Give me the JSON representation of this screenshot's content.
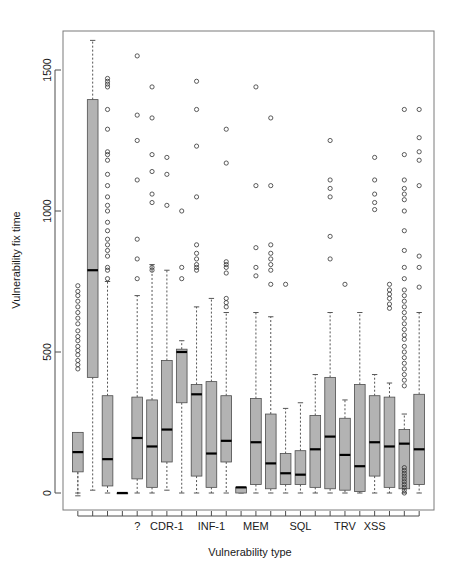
{
  "chart_data": {
    "type": "box",
    "title": "",
    "xlabel": "Vulnerability type",
    "ylabel": "Vulnerability fix time",
    "ylim": [
      -60,
      1680
    ],
    "yticks": [
      0,
      500,
      1000,
      1500
    ],
    "ytick_labels": [
      "0",
      "500",
      "1000",
      "1500"
    ],
    "grid": false,
    "legend": null,
    "n_categories": 24,
    "visible_category_labels": [
      "?",
      "CDR-1",
      "INF-1",
      "MEM",
      "SQL",
      "TRV",
      "XSS"
    ],
    "visible_category_label_indices": [
      4,
      6,
      9,
      12,
      15,
      18,
      20
    ],
    "box_fill_color": "#b3b3b3",
    "box_edge_color": "#4d4d4d",
    "median_color": "#000000",
    "whisker_style": "dashed",
    "outlier_marker": "open-circle",
    "boxes": [
      {
        "index": 0,
        "label": "",
        "lower_whisker": 0,
        "q1": 75,
        "median": 145,
        "q3": 215,
        "upper_whisker": -10,
        "outliers": [
          440,
          455,
          470,
          490,
          505,
          520,
          540,
          555,
          575,
          600,
          620,
          640,
          660,
          680,
          700,
          715,
          735
        ]
      },
      {
        "index": 1,
        "label": "",
        "lower_whisker": 10,
        "q1": 410,
        "median": 790,
        "q3": 1395,
        "upper_whisker": 1605,
        "outliers": []
      },
      {
        "index": 2,
        "label": "",
        "lower_whisker": 0,
        "q1": 25,
        "median": 120,
        "q3": 345,
        "upper_whisker": 750,
        "outliers": [
          760,
          790,
          800,
          840,
          860,
          880,
          900,
          930,
          960,
          1000,
          1020,
          1050,
          1090,
          1130,
          1180,
          1200,
          1210,
          1290,
          1360,
          1440,
          1450,
          1460,
          1470
        ]
      },
      {
        "index": 3,
        "label": "",
        "lower_whisker": 0,
        "q1": 0,
        "median": 0,
        "q3": 0,
        "upper_whisker": 0,
        "outliers": []
      },
      {
        "index": 4,
        "label": "?",
        "lower_whisker": 0,
        "q1": 50,
        "median": 195,
        "q3": 340,
        "upper_whisker": 700,
        "outliers": [
          760,
          830,
          900,
          1110,
          1250,
          1340,
          1550
        ]
      },
      {
        "index": 5,
        "label": "",
        "lower_whisker": 0,
        "q1": 20,
        "median": 165,
        "q3": 330,
        "upper_whisker": 810,
        "outliers": [
          790,
          800,
          1030,
          1060,
          1140,
          1200,
          1330,
          1440
        ]
      },
      {
        "index": 6,
        "label": "CDR-1",
        "lower_whisker": 10,
        "q1": 110,
        "median": 225,
        "q3": 470,
        "upper_whisker": 790,
        "outliers": [
          1020,
          1130,
          1190
        ]
      },
      {
        "index": 7,
        "label": "",
        "lower_whisker": 0,
        "q1": 320,
        "median": 500,
        "q3": 510,
        "upper_whisker": 540,
        "outliers": [
          760,
          800,
          1000
        ]
      },
      {
        "index": 8,
        "label": "",
        "lower_whisker": 0,
        "q1": 60,
        "median": 350,
        "q3": 385,
        "upper_whisker": 660,
        "outliers": [
          790,
          800,
          810,
          830,
          850,
          880,
          1050,
          1230,
          1360,
          1460
        ]
      },
      {
        "index": 9,
        "label": "INF-1",
        "lower_whisker": 0,
        "q1": 20,
        "median": 140,
        "q3": 395,
        "upper_whisker": 690,
        "outliers": []
      },
      {
        "index": 10,
        "label": "",
        "lower_whisker": 0,
        "q1": 110,
        "median": 185,
        "q3": 345,
        "upper_whisker": 640,
        "outliers": [
          660,
          675,
          690,
          780,
          800,
          810,
          820,
          1170,
          1290
        ]
      },
      {
        "index": 11,
        "label": "",
        "lower_whisker": 0,
        "q1": 0,
        "median": 20,
        "q3": 20,
        "upper_whisker": 20,
        "outliers": []
      },
      {
        "index": 12,
        "label": "MEM",
        "lower_whisker": 0,
        "q1": 30,
        "median": 180,
        "q3": 335,
        "upper_whisker": 640,
        "outliers": [
          770,
          800,
          870,
          1090,
          1440
        ]
      },
      {
        "index": 13,
        "label": "",
        "lower_whisker": 0,
        "q1": 15,
        "median": 105,
        "q3": 280,
        "upper_whisker": 625,
        "outliers": [
          740,
          790,
          810,
          830,
          850,
          880,
          1090,
          1330
        ]
      },
      {
        "index": 14,
        "label": "",
        "lower_whisker": 0,
        "q1": 30,
        "median": 70,
        "q3": 140,
        "upper_whisker": 300,
        "outliers": [
          740
        ]
      },
      {
        "index": 15,
        "label": "SQL",
        "lower_whisker": 0,
        "q1": 30,
        "median": 65,
        "q3": 150,
        "upper_whisker": 320,
        "outliers": []
      },
      {
        "index": 16,
        "label": "",
        "lower_whisker": 0,
        "q1": 20,
        "median": 155,
        "q3": 275,
        "upper_whisker": 420,
        "outliers": []
      },
      {
        "index": 17,
        "label": "",
        "lower_whisker": 0,
        "q1": 15,
        "median": 200,
        "q3": 410,
        "upper_whisker": 640,
        "outliers": [
          830,
          910,
          1050,
          1080,
          1110,
          1250
        ]
      },
      {
        "index": 18,
        "label": "TRV",
        "lower_whisker": 0,
        "q1": 10,
        "median": 135,
        "q3": 265,
        "upper_whisker": 330,
        "outliers": [
          740
        ]
      },
      {
        "index": 19,
        "label": "",
        "lower_whisker": 0,
        "q1": 5,
        "median": 95,
        "q3": 385,
        "upper_whisker": 640,
        "outliers": []
      },
      {
        "index": 20,
        "label": "XSS",
        "lower_whisker": 0,
        "q1": 60,
        "median": 180,
        "q3": 345,
        "upper_whisker": 420,
        "outliers": [
          1005,
          1030,
          1060,
          1110,
          1190
        ]
      },
      {
        "index": 21,
        "label": "",
        "lower_whisker": 0,
        "q1": 20,
        "median": 165,
        "q3": 340,
        "upper_whisker": 390,
        "outliers": [
          655,
          670,
          690,
          705,
          720,
          740
        ]
      },
      {
        "index": 22,
        "label": "",
        "lower_whisker": 0,
        "q1": 15,
        "median": 175,
        "q3": 225,
        "upper_whisker": 280,
        "outliers": [
          0,
          10,
          20,
          30,
          40,
          50,
          60,
          70,
          80,
          90,
          380,
          400,
          420,
          440,
          460,
          480,
          500,
          520,
          545,
          560,
          580,
          600,
          620,
          640,
          660,
          680,
          700,
          720,
          760,
          800,
          860,
          930,
          1000,
          1040,
          1060,
          1080,
          1110,
          1200,
          1360
        ]
      },
      {
        "index": 23,
        "label": "",
        "lower_whisker": 0,
        "q1": 30,
        "median": 155,
        "q3": 350,
        "upper_whisker": 640,
        "outliers": [
          730,
          800,
          840,
          1090,
          1180,
          1210,
          1260,
          1360
        ]
      }
    ]
  }
}
